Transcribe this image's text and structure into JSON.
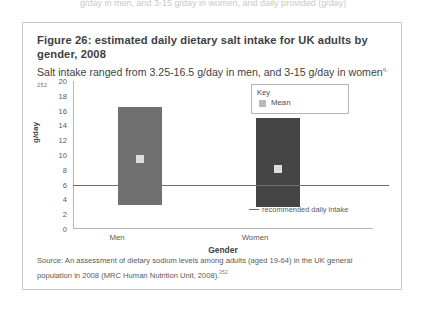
{
  "page": {
    "cutoff_text_top": "g/day in men, and 3-15 g/day in women, and daily provided (g/day)"
  },
  "figure": {
    "title": "Figure 26: estimated daily dietary salt intake for UK adults by gender, 2008",
    "subtitle": "Salt intake ranged from 3.25-16.5 g/day in men, and 3-15 g/day in women",
    "subtitle_superscript": "q, 252",
    "source": "Source: An assessment of dietary sodium levels among adults (aged 19-64) in the UK general population in 2008 (MRC Human Nutrition Unit, 2008).",
    "source_superscript": "252"
  },
  "legend": {
    "title": "Key",
    "items": [
      {
        "label": "Mean",
        "color": "#b9b9b9"
      }
    ]
  },
  "annotation": {
    "reference_label": "recommended daily intake"
  },
  "chart_data": {
    "type": "bar",
    "title": "Figure 26: estimated daily dietary salt intake for UK adults by gender, 2008",
    "subtitle": "Salt intake ranged from 3.25-16.5 g/day in men, and 3-15 g/day in women",
    "xlabel": "Gender",
    "ylabel": "g/day",
    "categories": [
      "Men",
      "Women"
    ],
    "ylim": [
      0,
      20
    ],
    "ytick_step": 2,
    "yticks": [
      20,
      18,
      16,
      14,
      12,
      10,
      8,
      6,
      4,
      2,
      0
    ],
    "grid": false,
    "legend_position": "top-right-inside",
    "bar_style": "floating-range",
    "series": [
      {
        "name": "Salt intake range",
        "bars": [
          {
            "category": "Men",
            "low": 3.25,
            "high": 16.5,
            "mean": 9.5,
            "color": "#707070"
          },
          {
            "category": "Women",
            "low": 3.0,
            "high": 15.0,
            "mean": 8.1,
            "color": "#454545"
          }
        ]
      }
    ],
    "reference_line": {
      "label": "recommended daily intake",
      "value": 6,
      "color": "#6e6e6e"
    },
    "mean_marker_color": "#dcdcdc"
  }
}
